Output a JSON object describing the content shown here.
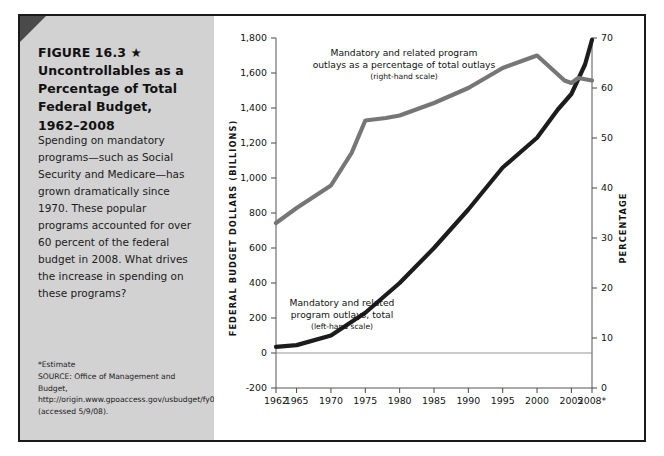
{
  "figure": {
    "title_lines": [
      "FIGURE 16.3 ★",
      "Uncontrollables as a",
      "Percentage of Total",
      "Federal Budget,",
      "1962–2008"
    ],
    "caption": "Spending on mandatory programs—such as Social Security and Medicare—has grown dramatically since 1970. These popular programs accounted for over 60 percent of the federal budget in 2008. What drives the increase in spending on these programs?",
    "estimate_note": "*Estimate",
    "source": "SOURCE: Office of Management and Budget, http://origin.www.gpoaccess.gov/usbudget/fy09/hist.html (accessed 5/9/08).",
    "panel_color": "#d2d2d2",
    "border_color": "#1a1a1a"
  },
  "chart_data": {
    "type": "line",
    "title": "Uncontrollables as a Percentage of Total Federal Budget, 1962–2008",
    "xlabel": "",
    "ylabel": "FEDERAL BUDGET DOLLARS (BILLIONS)",
    "y2label": "PERCENTAGE",
    "xlim": [
      1962,
      2008
    ],
    "ylim": [
      -200,
      1800
    ],
    "y2lim": [
      0,
      70
    ],
    "grid": false,
    "legend": "annotations-inline",
    "x_tick_labels": [
      "1962",
      "1965",
      "1970",
      "1975",
      "1980",
      "1985",
      "1990",
      "1995",
      "2000",
      "2005",
      "2008*"
    ],
    "x_ticks": [
      1962,
      1965,
      1970,
      1975,
      1980,
      1985,
      1990,
      1995,
      2000,
      2005,
      2008
    ],
    "y_tick_labels": [
      "-200",
      "0",
      "200",
      "400",
      "600",
      "800",
      "1,000",
      "1,200",
      "1,400",
      "1,600",
      "1,800"
    ],
    "y_ticks": [
      -200,
      0,
      200,
      400,
      600,
      800,
      1000,
      1200,
      1400,
      1600,
      1800
    ],
    "y2_tick_labels": [
      "0",
      "10",
      "20",
      "30",
      "40",
      "50",
      "60",
      "70"
    ],
    "y2_ticks": [
      0,
      10,
      20,
      30,
      40,
      50,
      60,
      70
    ],
    "series": [
      {
        "name": "Mandatory and related program outlays, total",
        "axis": "left",
        "color": "#1c1c1c",
        "annotation": "Mandatory and related\nprogram outlays, total",
        "annotation_sub": "(left-hand scale)",
        "x": [
          1962,
          1965,
          1970,
          1975,
          1980,
          1985,
          1990,
          1995,
          2000,
          2003,
          2005,
          2007,
          2008
        ],
        "values": [
          35,
          45,
          100,
          230,
          400,
          600,
          820,
          1060,
          1230,
          1390,
          1480,
          1650,
          1790
        ]
      },
      {
        "name": "Mandatory and related program outlays as a percentage of total outlays",
        "axis": "right",
        "color": "#767676",
        "annotation": "Mandatory and related program\noutlays as a percentage of total outlays",
        "annotation_sub": "(right-hand scale)",
        "x": [
          1962,
          1965,
          1970,
          1973,
          1975,
          1978,
          1980,
          1985,
          1990,
          1995,
          2000,
          2002,
          2004,
          2005,
          2006,
          2008
        ],
        "values": [
          33.0,
          36.0,
          40.5,
          47.0,
          53.5,
          54.0,
          54.5,
          57.0,
          60.0,
          64.0,
          66.5,
          64.0,
          61.5,
          61.0,
          62.0,
          61.5
        ]
      }
    ]
  }
}
